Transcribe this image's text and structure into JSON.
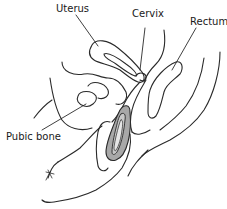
{
  "diagram": {
    "type": "anatomical cross-section illustration",
    "labels": {
      "uterus": "Uterus",
      "cervix": "Cervix",
      "rectum": "Rectum",
      "pubic_bone": "Pubic bone"
    },
    "colors": {
      "line": "#2a2a2a",
      "device_fill": "#a8a8a8",
      "background": "#ffffff"
    }
  }
}
